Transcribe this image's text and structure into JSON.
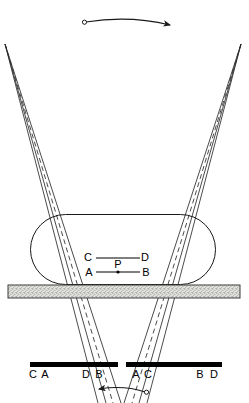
{
  "figure": {
    "colors": {
      "stroke": "#1a1a1a",
      "solid_ray": "#2b2b2b",
      "dashed_ray": "#2b2b2b",
      "bar_fill": "#000000",
      "band_fill": "#d8d8d4",
      "band_stroke": "#444444",
      "stipple": "#7a7a7a",
      "background": "#ffffff"
    },
    "top_arrow": {
      "name": "top-oscillation-arrow",
      "direction": "right",
      "pivot_x": 85,
      "pivot_y": 22,
      "tip_x": 172,
      "tip_y": 25
    },
    "bottom_arrow": {
      "name": "bottom-oscillation-arrow",
      "direction": "left",
      "pivot_x": 147,
      "pivot_y": 392,
      "tip_x": 97,
      "tip_y": 389
    },
    "left_apex": {
      "x": 5,
      "y": 44
    },
    "right_apex": {
      "x": 241,
      "y": 44
    },
    "stadium": {
      "x": 30,
      "y": 214,
      "width": 186,
      "height": 71,
      "radius": 35
    },
    "band": {
      "x": 8,
      "y": 285,
      "width": 232,
      "height": 13
    },
    "bars": [
      {
        "name": "left-image-bar",
        "x": 30,
        "y": 362,
        "width": 88,
        "height": 5
      },
      {
        "name": "right-image-bar",
        "x": 126,
        "y": 362,
        "width": 96,
        "height": 5
      }
    ],
    "object_points": {
      "upper_segment": {
        "x1": 92,
        "y1": 258,
        "x2": 143,
        "y2": 258
      },
      "lower_segment": {
        "x1": 93,
        "y1": 272,
        "x2": 143,
        "y2": 272
      },
      "center_dot": {
        "x": 118,
        "y": 272
      }
    },
    "labels": {
      "object": [
        {
          "text": "C",
          "x": 88,
          "y": 259,
          "name": "object-label-c"
        },
        {
          "text": "D",
          "x": 141,
          "y": 259,
          "name": "object-label-d"
        },
        {
          "text": "A",
          "x": 88,
          "y": 274,
          "name": "object-label-a"
        },
        {
          "text": "P",
          "x": 114,
          "y": 268,
          "name": "object-label-p"
        },
        {
          "text": "B",
          "x": 141,
          "y": 274,
          "name": "object-label-b"
        }
      ],
      "image": [
        {
          "text": "C",
          "x": 29,
          "y": 378,
          "name": "image-label-c-left"
        },
        {
          "text": "A",
          "x": 41,
          "y": 378,
          "name": "image-label-a-left"
        },
        {
          "text": "D",
          "x": 82,
          "y": 378,
          "name": "image-label-d-left"
        },
        {
          "text": "B",
          "x": 95,
          "y": 378,
          "name": "image-label-b-left"
        },
        {
          "text": "A",
          "x": 131,
          "y": 378,
          "name": "image-label-a-right"
        },
        {
          "text": "C",
          "x": 143,
          "y": 378,
          "name": "image-label-c-right"
        },
        {
          "text": "B",
          "x": 196,
          "y": 378,
          "name": "image-label-b-right"
        },
        {
          "text": "D",
          "x": 210,
          "y": 378,
          "name": "image-label-d-right"
        }
      ]
    },
    "rays": {
      "solid": [
        {
          "x1": 5,
          "y1": 44,
          "x2": 105,
          "y2": 403
        },
        {
          "x1": 5,
          "y1": 44,
          "x2": 120,
          "y2": 403
        },
        {
          "x1": 241,
          "y1": 44,
          "x2": 138,
          "y2": 403
        },
        {
          "x1": 241,
          "y1": 44,
          "x2": 123,
          "y2": 403
        },
        {
          "x1": 5,
          "y1": 44,
          "x2": 99,
          "y2": 403
        },
        {
          "x1": 241,
          "y1": 44,
          "x2": 146,
          "y2": 403
        }
      ],
      "dashed": [
        {
          "x1": 5,
          "y1": 44,
          "x2": 112,
          "y2": 403
        },
        {
          "x1": 241,
          "y1": 44,
          "x2": 131,
          "y2": 403
        }
      ]
    }
  }
}
